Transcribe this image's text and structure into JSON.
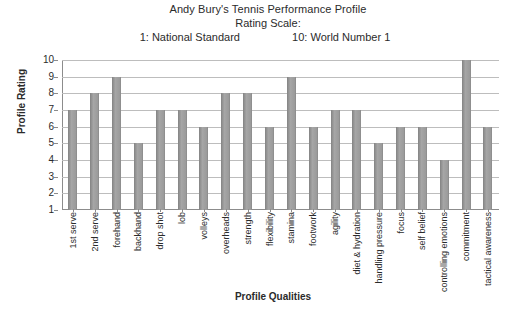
{
  "chart_data": {
    "type": "bar",
    "title": "Andy Bury's Tennis Performance Profile",
    "subtitle": "Rating Scale:",
    "scale_low": "1: National Standard",
    "scale_high": "10: World Number 1",
    "xlabel": "Profile Qualities",
    "ylabel": "Profile Rating",
    "ylim": [
      1,
      10
    ],
    "yticks": [
      10,
      9,
      8,
      7,
      6,
      5,
      4,
      3,
      2,
      1
    ],
    "grid": true,
    "legend": "none",
    "bar_color": "#9a9a9a",
    "categories": [
      "1st serve",
      "2nd serve",
      "forehand",
      "backhand",
      "drop shot",
      "lob",
      "volleys",
      "overheads",
      "strength",
      "flexibility",
      "stamina",
      "footwork",
      "agility",
      "diet & hydration",
      "handling pressure",
      "focus",
      "self belief",
      "controlling emotions",
      "commitment",
      "tactical awareness"
    ],
    "values": [
      7,
      8,
      9,
      5,
      7,
      7,
      6,
      8,
      8,
      6,
      9,
      6,
      7,
      7,
      5,
      6,
      6,
      4,
      10,
      6
    ]
  }
}
